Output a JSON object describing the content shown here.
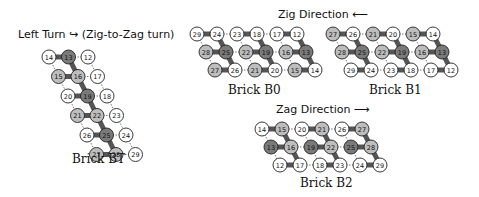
{
  "titles": {
    "left_turn": "Left Turn ↪ (Zig-to-Zag turn)",
    "zig": "Zig Direction ⟵",
    "zag": "Zag Direction ⟶"
  },
  "captions": {
    "bt": "Brick BT",
    "b0": "Brick B0",
    "b1": "Brick B1",
    "b2": "Brick B2"
  },
  "colors": {
    "light": "#ffffff",
    "mid": "#bdbdbd",
    "dark": "#7a7a7a",
    "connector": "#555555"
  },
  "bricks": {
    "bt": {
      "rows": [
        [
          {
            "n": "14",
            "c": "light"
          },
          {
            "n": "13",
            "c": "dark"
          },
          {
            "n": "12",
            "c": "light"
          }
        ],
        [
          {
            "n": "15",
            "c": "mid"
          },
          {
            "n": "16",
            "c": "mid"
          },
          {
            "n": "17",
            "c": "light"
          }
        ],
        [
          {
            "n": "20",
            "c": "light"
          },
          {
            "n": "19",
            "c": "dark"
          },
          {
            "n": "18",
            "c": "light"
          }
        ],
        [
          {
            "n": "21",
            "c": "mid"
          },
          {
            "n": "22",
            "c": "mid"
          },
          {
            "n": "23",
            "c": "light"
          }
        ],
        [
          {
            "n": "26",
            "c": "light"
          },
          {
            "n": "25",
            "c": "dark"
          },
          {
            "n": "24",
            "c": "light"
          }
        ],
        [
          {
            "n": "27",
            "c": "mid"
          },
          {
            "n": "28",
            "c": "mid"
          },
          {
            "n": "29",
            "c": "light"
          }
        ]
      ]
    },
    "b0": {
      "rows": [
        [
          {
            "n": "29",
            "c": "light"
          },
          {
            "n": "24",
            "c": "light"
          },
          {
            "n": "23",
            "c": "light"
          },
          {
            "n": "18",
            "c": "light"
          },
          {
            "n": "17",
            "c": "light"
          },
          {
            "n": "12",
            "c": "light"
          }
        ],
        [
          {
            "n": "28",
            "c": "mid"
          },
          {
            "n": "25",
            "c": "dark"
          },
          {
            "n": "22",
            "c": "mid"
          },
          {
            "n": "19",
            "c": "dark"
          },
          {
            "n": "16",
            "c": "mid"
          },
          {
            "n": "13",
            "c": "dark"
          }
        ],
        [
          {
            "n": "27",
            "c": "mid"
          },
          {
            "n": "26",
            "c": "light"
          },
          {
            "n": "21",
            "c": "mid"
          },
          {
            "n": "20",
            "c": "light"
          },
          {
            "n": "15",
            "c": "mid"
          },
          {
            "n": "14",
            "c": "light"
          }
        ]
      ]
    },
    "b1": {
      "rows": [
        [
          {
            "n": "27",
            "c": "mid"
          },
          {
            "n": "26",
            "c": "light"
          },
          {
            "n": "21",
            "c": "mid"
          },
          {
            "n": "20",
            "c": "light"
          },
          {
            "n": "15",
            "c": "mid"
          },
          {
            "n": "14",
            "c": "light"
          }
        ],
        [
          {
            "n": "28",
            "c": "mid"
          },
          {
            "n": "25",
            "c": "dark"
          },
          {
            "n": "22",
            "c": "mid"
          },
          {
            "n": "19",
            "c": "dark"
          },
          {
            "n": "16",
            "c": "mid"
          },
          {
            "n": "13",
            "c": "dark"
          }
        ],
        [
          {
            "n": "29",
            "c": "light"
          },
          {
            "n": "24",
            "c": "light"
          },
          {
            "n": "23",
            "c": "light"
          },
          {
            "n": "18",
            "c": "light"
          },
          {
            "n": "17",
            "c": "light"
          },
          {
            "n": "12",
            "c": "light"
          }
        ]
      ]
    },
    "b2": {
      "rows": [
        [
          {
            "n": "14",
            "c": "light"
          },
          {
            "n": "15",
            "c": "mid"
          },
          {
            "n": "20",
            "c": "light"
          },
          {
            "n": "21",
            "c": "mid"
          },
          {
            "n": "26",
            "c": "light"
          },
          {
            "n": "27",
            "c": "mid"
          }
        ],
        [
          {
            "n": "13",
            "c": "dark"
          },
          {
            "n": "16",
            "c": "mid"
          },
          {
            "n": "19",
            "c": "dark"
          },
          {
            "n": "22",
            "c": "mid"
          },
          {
            "n": "25",
            "c": "dark"
          },
          {
            "n": "28",
            "c": "mid"
          }
        ],
        [
          {
            "n": "12",
            "c": "light"
          },
          {
            "n": "17",
            "c": "light"
          },
          {
            "n": "18",
            "c": "light"
          },
          {
            "n": "23",
            "c": "light"
          },
          {
            "n": "24",
            "c": "light"
          },
          {
            "n": "29",
            "c": "light"
          }
        ]
      ]
    }
  }
}
